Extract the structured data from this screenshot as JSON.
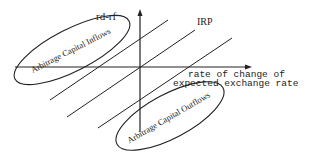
{
  "diagram": {
    "y_axis_label": "rd-rf",
    "x_axis_label_line1": "rate of change of",
    "x_axis_label_line2": "expected exchange rate",
    "irp_label": "IRP",
    "region_upper_left": "Arbitrage Capital Inflows",
    "region_lower_right": "Arbitrage Capital Outflows",
    "colors": {
      "line": "#222222",
      "background": "#ffffff"
    }
  }
}
